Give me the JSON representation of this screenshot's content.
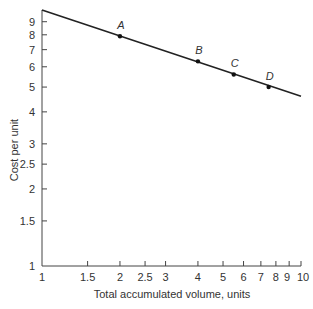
{
  "chart_data": {
    "type": "line",
    "title": "",
    "xlabel": "Total accumulated volume, units",
    "ylabel": "Cost per unit",
    "xscale": "log",
    "yscale": "log",
    "xlim": [
      1,
      10
    ],
    "ylim": [
      1,
      10
    ],
    "grid": false,
    "x_ticks": [
      1,
      1.5,
      2,
      2.5,
      3,
      4,
      5,
      6,
      7,
      8,
      9,
      10
    ],
    "x_tick_labels": [
      "1",
      "1.5",
      "2",
      "2.5",
      "3",
      "4",
      "5",
      "6",
      "7",
      "8",
      "9",
      "10"
    ],
    "y_ticks": [
      1,
      1.5,
      2,
      2.5,
      3,
      4,
      5,
      6,
      7,
      8,
      9
    ],
    "y_tick_labels": [
      "1",
      "1.5",
      "2",
      "2.5",
      "3",
      "4",
      "5",
      "6",
      "7",
      "8",
      "9"
    ],
    "series": [
      {
        "name": "Experience curve",
        "x": [
          1,
          10
        ],
        "y": [
          10,
          4.6
        ]
      }
    ],
    "points": [
      {
        "label": "A",
        "x": 2,
        "y": 7.9
      },
      {
        "label": "B",
        "x": 4,
        "y": 6.3
      },
      {
        "label": "C",
        "x": 5.5,
        "y": 5.6
      },
      {
        "label": "D",
        "x": 7.5,
        "y": 5.0
      }
    ]
  }
}
